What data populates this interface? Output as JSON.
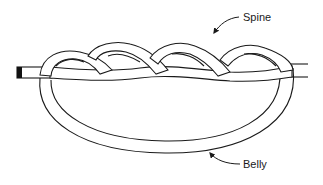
{
  "diagram": {
    "type": "knot-illustration",
    "labels": {
      "spine": "Spine",
      "belly": "Belly"
    },
    "colors": {
      "line": "#1a1a1a",
      "rope_fill": "#ffffff",
      "end_cap": "#111111",
      "background": "#ffffff"
    }
  }
}
